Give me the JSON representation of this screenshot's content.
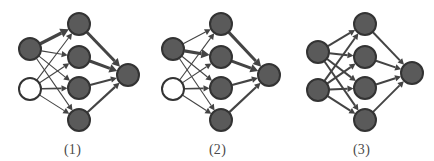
{
  "figure": {
    "background": "#ffffff",
    "width": 434,
    "height": 161,
    "type": "neural-network-diagram-set",
    "panel_count": 3
  },
  "style": {
    "node_fill_gray": "#5a5a5a",
    "node_fill_white": "#ffffff",
    "node_stroke": "#333333",
    "edge_color": "#444444",
    "caption_color": "#4a4a4a",
    "node_radius": 11,
    "node_stroke_width": 2
  },
  "panels": [
    {
      "id": "panel-1",
      "caption": "(1)",
      "layers": [
        {
          "name": "input",
          "nodes": [
            {
              "id": "i1",
              "cx": 30,
              "cy": 49,
              "state": "active",
              "fill": "#5a5a5a"
            },
            {
              "id": "i2",
              "cx": 30,
              "cy": 89,
              "state": "inactive",
              "fill": "#ffffff"
            }
          ]
        },
        {
          "name": "hidden",
          "nodes": [
            {
              "id": "h1",
              "cx": 79,
              "cy": 24,
              "state": "active",
              "fill": "#5a5a5a"
            },
            {
              "id": "h2",
              "cx": 79,
              "cy": 57,
              "state": "active",
              "fill": "#5a5a5a"
            },
            {
              "id": "h3",
              "cx": 79,
              "cy": 88,
              "state": "active",
              "fill": "#5a5a5a"
            },
            {
              "id": "h4",
              "cx": 79,
              "cy": 120,
              "state": "active",
              "fill": "#5a5a5a"
            }
          ]
        },
        {
          "name": "output",
          "nodes": [
            {
              "id": "o1",
              "cx": 128,
              "cy": 75,
              "state": "active",
              "fill": "#5a5a5a"
            }
          ]
        }
      ],
      "edges": [
        {
          "from": "i1",
          "to": "h1",
          "weight": "heavy",
          "width": 3.2
        },
        {
          "from": "i1",
          "to": "h2",
          "weight": "light",
          "width": 1.1
        },
        {
          "from": "i1",
          "to": "h3",
          "weight": "light",
          "width": 1.1
        },
        {
          "from": "i1",
          "to": "h4",
          "weight": "light",
          "width": 1.1
        },
        {
          "from": "i2",
          "to": "h1",
          "weight": "light",
          "width": 1.1
        },
        {
          "from": "i2",
          "to": "h2",
          "weight": "light",
          "width": 1.1
        },
        {
          "from": "i2",
          "to": "h3",
          "weight": "medium",
          "width": 1.7
        },
        {
          "from": "i2",
          "to": "h4",
          "weight": "light",
          "width": 1.1
        },
        {
          "from": "h1",
          "to": "o1",
          "weight": "heavy",
          "width": 3.0
        },
        {
          "from": "h2",
          "to": "o1",
          "weight": "heavy",
          "width": 3.0
        },
        {
          "from": "h3",
          "to": "o1",
          "weight": "medium",
          "width": 2.2
        },
        {
          "from": "h4",
          "to": "o1",
          "weight": "medium",
          "width": 2.2
        }
      ]
    },
    {
      "id": "panel-2",
      "caption": "(2)",
      "layers": [
        {
          "name": "input",
          "nodes": [
            {
              "id": "i1",
              "cx": 28,
              "cy": 49,
              "state": "active",
              "fill": "#5a5a5a"
            },
            {
              "id": "i2",
              "cx": 28,
              "cy": 89,
              "state": "inactive",
              "fill": "#ffffff"
            }
          ]
        },
        {
          "name": "hidden",
          "nodes": [
            {
              "id": "h1",
              "cx": 76,
              "cy": 24,
              "state": "active",
              "fill": "#5a5a5a"
            },
            {
              "id": "h2",
              "cx": 76,
              "cy": 57,
              "state": "active",
              "fill": "#5a5a5a"
            },
            {
              "id": "h3",
              "cx": 76,
              "cy": 88,
              "state": "active",
              "fill": "#5a5a5a"
            },
            {
              "id": "h4",
              "cx": 76,
              "cy": 120,
              "state": "active",
              "fill": "#5a5a5a"
            }
          ]
        },
        {
          "name": "output",
          "nodes": [
            {
              "id": "o1",
              "cx": 124,
              "cy": 75,
              "state": "active",
              "fill": "#5a5a5a"
            }
          ]
        }
      ],
      "edges": [
        {
          "from": "i1",
          "to": "h1",
          "weight": "light",
          "width": 1.1
        },
        {
          "from": "i1",
          "to": "h2",
          "weight": "heavy",
          "width": 3.2
        },
        {
          "from": "i1",
          "to": "h3",
          "weight": "light",
          "width": 1.1
        },
        {
          "from": "i1",
          "to": "h4",
          "weight": "light",
          "width": 1.1
        },
        {
          "from": "i2",
          "to": "h1",
          "weight": "light",
          "width": 1.1
        },
        {
          "from": "i2",
          "to": "h2",
          "weight": "light",
          "width": 1.1
        },
        {
          "from": "i2",
          "to": "h3",
          "weight": "medium",
          "width": 1.7
        },
        {
          "from": "i2",
          "to": "h4",
          "weight": "light",
          "width": 1.1
        },
        {
          "from": "h1",
          "to": "o1",
          "weight": "heavy",
          "width": 3.0
        },
        {
          "from": "h2",
          "to": "o1",
          "weight": "heavy",
          "width": 3.0
        },
        {
          "from": "h3",
          "to": "o1",
          "weight": "medium",
          "width": 2.2
        },
        {
          "from": "h4",
          "to": "o1",
          "weight": "medium",
          "width": 2.2
        }
      ]
    },
    {
      "id": "panel-3",
      "caption": "(3)",
      "layers": [
        {
          "name": "input",
          "nodes": [
            {
              "id": "i1",
              "cx": 29,
              "cy": 52,
              "state": "active",
              "fill": "#5a5a5a"
            },
            {
              "id": "i2",
              "cx": 29,
              "cy": 90,
              "state": "active",
              "fill": "#5a5a5a"
            }
          ]
        },
        {
          "name": "hidden",
          "nodes": [
            {
              "id": "h1",
              "cx": 76,
              "cy": 24,
              "state": "active",
              "fill": "#5a5a5a"
            },
            {
              "id": "h2",
              "cx": 76,
              "cy": 57,
              "state": "active",
              "fill": "#5a5a5a"
            },
            {
              "id": "h3",
              "cx": 76,
              "cy": 88,
              "state": "active",
              "fill": "#5a5a5a"
            },
            {
              "id": "h4",
              "cx": 76,
              "cy": 120,
              "state": "active",
              "fill": "#5a5a5a"
            }
          ]
        },
        {
          "name": "output",
          "nodes": [
            {
              "id": "o1",
              "cx": 123,
              "cy": 73,
              "state": "active",
              "fill": "#5a5a5a"
            }
          ]
        }
      ],
      "edges": [
        {
          "from": "i1",
          "to": "h1",
          "weight": "medium",
          "width": 2.0
        },
        {
          "from": "i1",
          "to": "h2",
          "weight": "medium",
          "width": 2.0
        },
        {
          "from": "i1",
          "to": "h3",
          "weight": "medium",
          "width": 2.0
        },
        {
          "from": "i1",
          "to": "h4",
          "weight": "medium",
          "width": 2.0
        },
        {
          "from": "i2",
          "to": "h1",
          "weight": "medium",
          "width": 2.0
        },
        {
          "from": "i2",
          "to": "h2",
          "weight": "medium",
          "width": 2.0
        },
        {
          "from": "i2",
          "to": "h3",
          "weight": "medium",
          "width": 2.0
        },
        {
          "from": "i2",
          "to": "h4",
          "weight": "medium",
          "width": 2.0
        },
        {
          "from": "h1",
          "to": "o1",
          "weight": "medium",
          "width": 2.0
        },
        {
          "from": "h2",
          "to": "o1",
          "weight": "medium",
          "width": 2.0
        },
        {
          "from": "h3",
          "to": "o1",
          "weight": "medium",
          "width": 2.0
        },
        {
          "from": "h4",
          "to": "o1",
          "weight": "medium",
          "width": 2.0
        }
      ]
    }
  ]
}
